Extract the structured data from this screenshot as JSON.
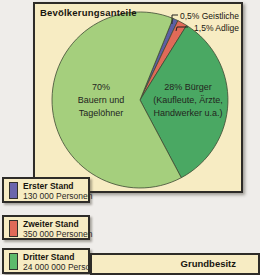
{
  "panel": {
    "title": "Bevölkerungsanteile"
  },
  "chart_data": {
    "type": "pie",
    "title": "Bevölkerungsanteile",
    "unit": "percent of population",
    "slices": [
      {
        "label": "Geistliche",
        "value": 0.5,
        "color": "#5c5fa4",
        "callout": "0,5% Geistliche"
      },
      {
        "label": "Adlige",
        "value": 1.5,
        "color": "#e06a58",
        "callout": "1,5% Adlige"
      },
      {
        "label": "Bürger (Kaufleute, Ärzte, Handwerker u.a.)",
        "value": 28,
        "color": "#4aa863",
        "label_lines": [
          "28% Bürger",
          "(Kaufleute, Ärzte,",
          "Handwerker u.a.)"
        ]
      },
      {
        "label": "Bauern und Tagelöhner",
        "value": 70,
        "color": "#a5cf7d",
        "label_lines": [
          "70%",
          "Bauern und",
          "Tagelöhner"
        ]
      }
    ],
    "outline_color": "#3d4a33",
    "legend_position": "bottom-left",
    "drawn_segment_angles_deg": [
      [
        22,
        25.5
      ],
      [
        25.5,
        32
      ],
      [
        32,
        152
      ],
      [
        152,
        382
      ]
    ]
  },
  "legend": [
    {
      "name": "Erster Stand",
      "count": "130 000 Personen",
      "color": "#6b66ac"
    },
    {
      "name": "Zweiter Stand",
      "count": "350 000 Personen",
      "color": "#e06a58"
    },
    {
      "name": "Dritter Stand",
      "count": "24 000 000 Personen",
      "color": "#5eba6b"
    }
  ],
  "next_panel": {
    "title": "Grundbesitz"
  },
  "colors": {
    "panel_bg": "#f7ecc3",
    "panel_border": "#2e2c28",
    "page_bg": "#efedea"
  }
}
